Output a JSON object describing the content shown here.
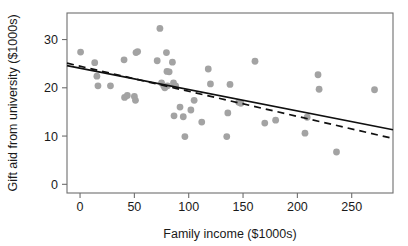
{
  "chart_data": {
    "type": "scatter",
    "title": "",
    "xlabel": "Family income ($1000s)",
    "ylabel": "Gift aid from university ($1000s)",
    "xlim": [
      -12,
      288
    ],
    "ylim": [
      -1.8,
      35.5
    ],
    "xticks": [
      0,
      50,
      100,
      150,
      200,
      250
    ],
    "xtick_labels": [
      "0",
      "50",
      "100",
      "150",
      "200",
      "250"
    ],
    "yticks": [
      0,
      10,
      20,
      30
    ],
    "ytick_labels": [
      "0",
      "10",
      "20",
      "30"
    ],
    "grid": false,
    "legend": "none",
    "point_color": "#a3a3a3",
    "line_color": "#101010",
    "frame_color": "#6e6e6e",
    "points": [
      {
        "x": 0.5,
        "y": 27.4
      },
      {
        "x": 13.5,
        "y": 25.2
      },
      {
        "x": 15.5,
        "y": 22.4
      },
      {
        "x": 16.5,
        "y": 20.4
      },
      {
        "x": 28.0,
        "y": 20.4
      },
      {
        "x": 40.5,
        "y": 25.8
      },
      {
        "x": 41.0,
        "y": 18.0
      },
      {
        "x": 43.5,
        "y": 18.4
      },
      {
        "x": 50.0,
        "y": 18.2
      },
      {
        "x": 51.0,
        "y": 17.4
      },
      {
        "x": 51.5,
        "y": 27.3
      },
      {
        "x": 53.0,
        "y": 27.5
      },
      {
        "x": 71.0,
        "y": 25.6
      },
      {
        "x": 73.5,
        "y": 32.3
      },
      {
        "x": 75.0,
        "y": 21.0
      },
      {
        "x": 77.0,
        "y": 20.4
      },
      {
        "x": 78.0,
        "y": 20.0
      },
      {
        "x": 79.5,
        "y": 27.3
      },
      {
        "x": 80.0,
        "y": 23.4
      },
      {
        "x": 80.5,
        "y": 20.4
      },
      {
        "x": 82.0,
        "y": 23.3
      },
      {
        "x": 85.0,
        "y": 25.3
      },
      {
        "x": 86.0,
        "y": 21.0
      },
      {
        "x": 86.5,
        "y": 14.2
      },
      {
        "x": 88.0,
        "y": 20.4
      },
      {
        "x": 92.0,
        "y": 16.0
      },
      {
        "x": 95.0,
        "y": 14.0
      },
      {
        "x": 96.5,
        "y": 9.9
      },
      {
        "x": 102.0,
        "y": 15.4
      },
      {
        "x": 105.0,
        "y": 17.4
      },
      {
        "x": 112.0,
        "y": 12.9
      },
      {
        "x": 118.0,
        "y": 23.9
      },
      {
        "x": 120.0,
        "y": 20.8
      },
      {
        "x": 135.0,
        "y": 9.9
      },
      {
        "x": 136.0,
        "y": 14.8
      },
      {
        "x": 138.0,
        "y": 20.7
      },
      {
        "x": 146.0,
        "y": 17.0
      },
      {
        "x": 148.0,
        "y": 16.8
      },
      {
        "x": 161.0,
        "y": 25.5
      },
      {
        "x": 170.0,
        "y": 12.7
      },
      {
        "x": 180.0,
        "y": 13.3
      },
      {
        "x": 207.0,
        "y": 10.6
      },
      {
        "x": 209.0,
        "y": 13.9
      },
      {
        "x": 219.0,
        "y": 22.7
      },
      {
        "x": 220.0,
        "y": 19.7
      },
      {
        "x": 236.0,
        "y": 6.7
      },
      {
        "x": 271.0,
        "y": 19.6
      }
    ],
    "lines": [
      {
        "name": "least-squares-fit-solid",
        "style": "solid",
        "x_start": -12,
        "y_start": 24.6,
        "x_end": 288,
        "y_end": 11.3
      },
      {
        "name": "robust-fit-dashed",
        "style": "dashed",
        "x_start": -12,
        "y_start": 25.1,
        "x_end": 288,
        "y_end": 9.5
      }
    ]
  }
}
